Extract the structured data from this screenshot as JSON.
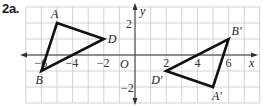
{
  "problem": {
    "label": "2a."
  },
  "graph": {
    "x_range": [
      -7,
      8
    ],
    "y_range": [
      -3,
      3
    ],
    "axis_labels": {
      "x": "x",
      "y": "y",
      "origin": "O"
    },
    "x_ticks": [
      {
        "value": -6,
        "label": "−6"
      },
      {
        "value": -4,
        "label": "−4"
      },
      {
        "value": -2,
        "label": "−2"
      },
      {
        "value": 2,
        "label": "2"
      },
      {
        "value": 4,
        "label": "4"
      },
      {
        "value": 6,
        "label": "6"
      }
    ],
    "y_ticks": [
      {
        "value": 2,
        "label": "2"
      },
      {
        "value": -2,
        "label": "−2"
      }
    ],
    "triangle_original": {
      "vertices": [
        {
          "name": "A",
          "x": -5,
          "y": 2
        },
        {
          "name": "D",
          "x": -2,
          "y": 1
        },
        {
          "name": "B",
          "x": -6,
          "y": -1
        }
      ]
    },
    "triangle_image": {
      "vertices": [
        {
          "name": "B′",
          "x": 6,
          "y": 1
        },
        {
          "name": "A′",
          "x": 5,
          "y": -2
        },
        {
          "name": "D′",
          "x": 2,
          "y": -1
        }
      ]
    },
    "colors": {
      "grid": "#c8c8c8",
      "stroke": "#111111",
      "axis": "#333333"
    }
  }
}
